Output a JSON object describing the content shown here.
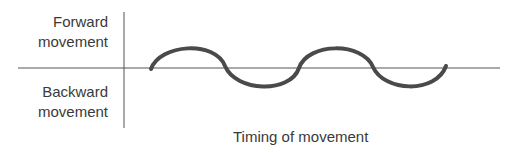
{
  "diagram": {
    "y_labels": {
      "top": [
        "Forward",
        "movement"
      ],
      "bottom": [
        "Backward",
        "movement"
      ]
    },
    "x_label": "Timing of movement",
    "curve": {
      "type": "sinusoid",
      "cycles": 2,
      "starts_phase": "forward",
      "color": "#4a4a4a"
    },
    "axis_color": "#555555"
  }
}
